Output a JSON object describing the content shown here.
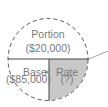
{
  "diagram": {
    "top": {
      "label": "Portion",
      "value": "($20,000)"
    },
    "bottom_left": {
      "label": "Base",
      "operator": "×",
      "value": "($85,000)"
    },
    "bottom_right": {
      "label": "Rate",
      "value": "(?)"
    },
    "colors": {
      "circle_stroke": "#555555",
      "shaded_fill": "#c8c8c8",
      "text": "#7a7a7a",
      "background": "#ffffff"
    }
  }
}
